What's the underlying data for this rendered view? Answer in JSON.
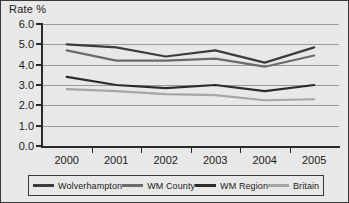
{
  "chart_data": {
    "type": "line",
    "title": "Rate %",
    "xlabel": "",
    "ylabel": "Rate %",
    "categories": [
      "2000",
      "2001",
      "2002",
      "2003",
      "2004",
      "2005"
    ],
    "x": [
      2000,
      2001,
      2002,
      2003,
      2004,
      2005
    ],
    "ylim": [
      0.0,
      6.0
    ],
    "ytick_labels": [
      "6.0",
      "5.0",
      "4.0",
      "3.0",
      "2.0",
      "1.0",
      "0.0"
    ],
    "ytick_values": [
      6.0,
      5.0,
      4.0,
      3.0,
      2.0,
      1.0,
      0.0
    ],
    "grid": true,
    "legend_position": "bottom",
    "series": [
      {
        "name": "Wolverhampton",
        "color": "#3c3c3c",
        "width": 2.2,
        "values": [
          5.0,
          4.85,
          4.4,
          4.7,
          4.1,
          4.85
        ]
      },
      {
        "name": "WM County",
        "color": "#6b6b6b",
        "width": 2.2,
        "values": [
          4.7,
          4.2,
          4.2,
          4.3,
          3.9,
          4.45
        ]
      },
      {
        "name": "WM Region",
        "color": "#2b2b2b",
        "width": 2.2,
        "values": [
          3.4,
          3.0,
          2.85,
          3.0,
          2.7,
          3.0
        ]
      },
      {
        "name": "Britain",
        "color": "#a6a6a6",
        "width": 2.2,
        "values": [
          2.8,
          2.7,
          2.55,
          2.5,
          2.25,
          2.3
        ]
      }
    ]
  },
  "legend": {
    "items": [
      {
        "label": "Wolverhampton",
        "color": "#3c3c3c"
      },
      {
        "label": "WM County",
        "color": "#6b6b6b"
      },
      {
        "label": "WM Region",
        "color": "#2b2b2b"
      },
      {
        "label": "Britain",
        "color": "#a6a6a6"
      }
    ]
  },
  "colors": {
    "panel_background": "#e8e8e8",
    "gridline": "#9a9a9a",
    "axis": "#2b2b2b",
    "text": "#1a1a1a",
    "border": "#3a3a3a"
  }
}
